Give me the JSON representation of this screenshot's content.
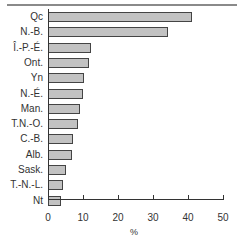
{
  "chart_data": {
    "type": "bar",
    "orientation": "horizontal",
    "title": "",
    "xlabel": "%",
    "ylabel": "",
    "xlim": [
      0,
      50
    ],
    "x_ticks": [
      "0",
      "10",
      "20",
      "30",
      "40",
      "50"
    ],
    "grid": false,
    "legend": null,
    "categories": [
      "Qc",
      "N.-B.",
      "Î.-P.-É.",
      "Ont.",
      "Yn",
      "N.-É.",
      "Man.",
      "T.N.-O.",
      "C.-B.",
      "Alb.",
      "Sask.",
      "T.-N.-L.",
      "Nt"
    ],
    "values": [
      41.0,
      34.3,
      12.2,
      11.7,
      10.4,
      10.1,
      9.2,
      8.5,
      7.1,
      6.9,
      5.0,
      4.4,
      3.8
    ]
  }
}
